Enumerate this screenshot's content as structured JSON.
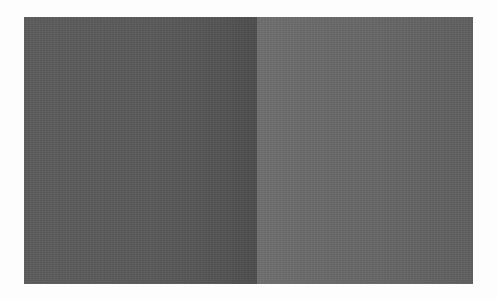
{
  "image": {
    "description": "Two adjacent gray rectangular panels (brightness illusion)",
    "panels": [
      {
        "name": "left",
        "colors": {
          "start": "#5c5c5c",
          "end": "#4d4d4d"
        }
      },
      {
        "name": "right",
        "colors": {
          "start": "#6f6f6f",
          "end": "#5f5f5f"
        }
      }
    ],
    "background": "#fdfdfd"
  }
}
